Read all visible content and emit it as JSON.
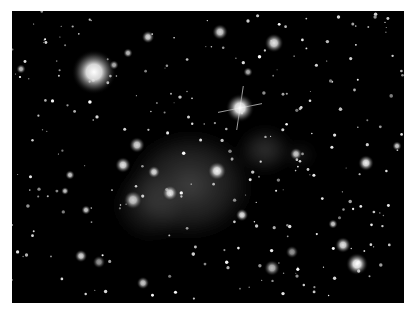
{
  "image": {
    "subject": "galaxy cluster with diffuse intracluster glow",
    "background": "#000000",
    "frame": {
      "x": 12,
      "y": 11,
      "width": 392,
      "height": 292
    },
    "glows": [
      {
        "cx": 190,
        "cy": 185,
        "rx": 70,
        "ry": 60,
        "opacity": 0.42
      },
      {
        "cx": 150,
        "cy": 205,
        "rx": 40,
        "ry": 40,
        "opacity": 0.25
      },
      {
        "cx": 265,
        "cy": 150,
        "rx": 28,
        "ry": 24,
        "opacity": 0.35
      },
      {
        "cx": 300,
        "cy": 155,
        "rx": 15,
        "ry": 12,
        "opacity": 0.2
      }
    ],
    "spiked_star": {
      "cx": 240,
      "cy": 108,
      "r": 9,
      "spike_length": 22
    },
    "bright_sources": [
      {
        "cx": 94,
        "cy": 72,
        "r": 14,
        "b": 1.0
      },
      {
        "cx": 274,
        "cy": 43,
        "r": 6,
        "b": 0.9
      },
      {
        "cx": 220,
        "cy": 32,
        "r": 5,
        "b": 0.85
      },
      {
        "cx": 148,
        "cy": 37,
        "r": 4,
        "b": 0.85
      },
      {
        "cx": 123,
        "cy": 165,
        "r": 5,
        "b": 0.9
      },
      {
        "cx": 217,
        "cy": 171,
        "r": 6,
        "b": 0.95
      },
      {
        "cx": 137,
        "cy": 145,
        "r": 5,
        "b": 0.85
      },
      {
        "cx": 170,
        "cy": 193,
        "r": 5,
        "b": 0.9
      },
      {
        "cx": 133,
        "cy": 200,
        "r": 6,
        "b": 0.8
      },
      {
        "cx": 154,
        "cy": 172,
        "r": 4,
        "b": 0.85
      },
      {
        "cx": 296,
        "cy": 154,
        "r": 4,
        "b": 0.8
      },
      {
        "cx": 366,
        "cy": 163,
        "r": 5,
        "b": 0.95
      },
      {
        "cx": 397,
        "cy": 146,
        "r": 3,
        "b": 0.8
      },
      {
        "cx": 242,
        "cy": 215,
        "r": 4,
        "b": 0.9
      },
      {
        "cx": 343,
        "cy": 245,
        "r": 5,
        "b": 0.9
      },
      {
        "cx": 357,
        "cy": 264,
        "r": 7,
        "b": 1.0
      },
      {
        "cx": 272,
        "cy": 268,
        "r": 5,
        "b": 0.75
      },
      {
        "cx": 292,
        "cy": 252,
        "r": 4,
        "b": 0.6
      },
      {
        "cx": 81,
        "cy": 256,
        "r": 4,
        "b": 0.85
      },
      {
        "cx": 99,
        "cy": 262,
        "r": 4,
        "b": 0.6
      },
      {
        "cx": 143,
        "cy": 283,
        "r": 4,
        "b": 0.8
      },
      {
        "cx": 70,
        "cy": 175,
        "r": 3,
        "b": 0.8
      },
      {
        "cx": 86,
        "cy": 210,
        "r": 3,
        "b": 0.8
      },
      {
        "cx": 21,
        "cy": 69,
        "r": 3,
        "b": 0.75
      },
      {
        "cx": 128,
        "cy": 53,
        "r": 3,
        "b": 0.75
      },
      {
        "cx": 248,
        "cy": 72,
        "r": 3,
        "b": 0.7
      },
      {
        "cx": 333,
        "cy": 224,
        "r": 3,
        "b": 0.8
      },
      {
        "cx": 114,
        "cy": 65,
        "r": 3,
        "b": 0.7
      },
      {
        "cx": 65,
        "cy": 191,
        "r": 2.5,
        "b": 0.8
      }
    ],
    "faint_source_count": 260,
    "faint_source_seed": 7
  }
}
